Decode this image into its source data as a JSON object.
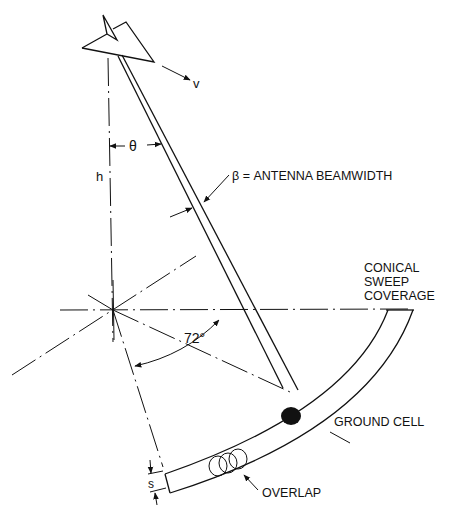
{
  "diagram": {
    "type": "radar conical sweep geometry",
    "labels": {
      "velocity": "v",
      "theta": "θ",
      "height": "h",
      "beamwidth": "β = ANTENNA BEAMWIDTH",
      "coverage_line1": "CONICAL",
      "coverage_line2": "SWEEP",
      "coverage_line3": "COVERAGE",
      "angle": "72°",
      "ground_cell": "GROUND CELL",
      "overlap": "OVERLAP",
      "spacing": "s"
    },
    "colors": {
      "ink": "#111111",
      "background": "#ffffff"
    }
  }
}
